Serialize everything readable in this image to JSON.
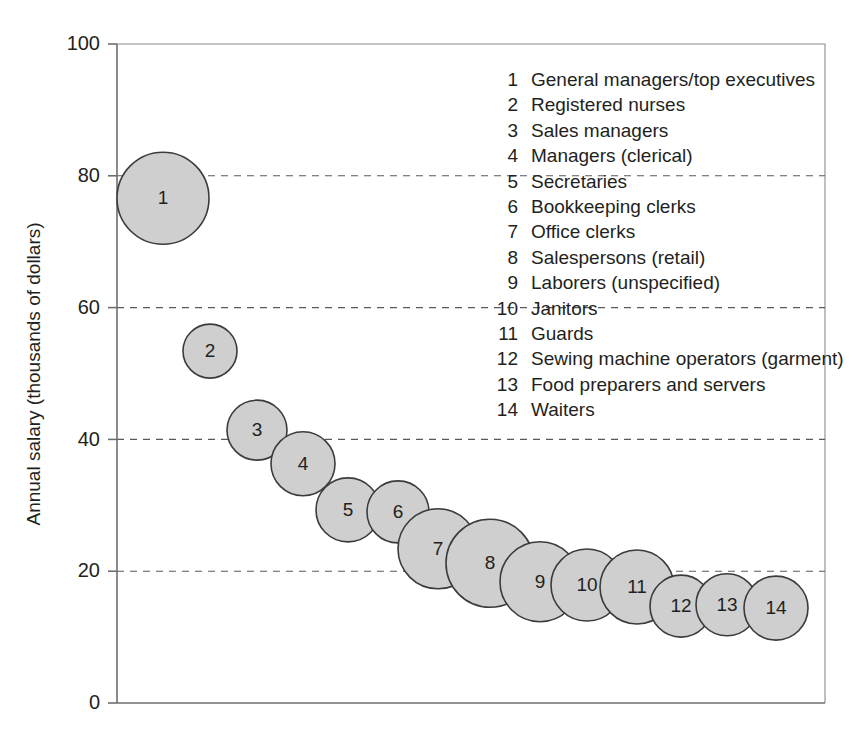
{
  "chart_data": {
    "type": "scatter",
    "title": "",
    "xlabel": "",
    "ylabel": "Annual salary (thousands of dollars)",
    "ylim": [
      0,
      100
    ],
    "yticks": [
      0,
      20,
      40,
      60,
      80,
      100
    ],
    "ytick_labels": [
      "0",
      "20",
      "40",
      "60",
      "80",
      "100"
    ],
    "grid": "horizontal-dashed",
    "legend_position": "inside-top-right",
    "xaxis_ticks": false,
    "note": "Bubble area encodes number of workers in each occupation; bubbles are ordered left to right by decreasing annual salary.",
    "points": [
      {
        "id": 1,
        "label": "1",
        "name": "General managers/top executives",
        "x": 1,
        "y": 76.6,
        "r_px": 46
      },
      {
        "id": 2,
        "label": "2",
        "name": "Registered nurses",
        "x": 2,
        "y": 53.4,
        "r_px": 27
      },
      {
        "id": 3,
        "label": "3",
        "name": "Sales managers",
        "x": 3,
        "y": 41.4,
        "r_px": 30
      },
      {
        "id": 4,
        "label": "4",
        "name": "Managers (clerical)",
        "x": 4,
        "y": 36.3,
        "r_px": 32
      },
      {
        "id": 5,
        "label": "5",
        "name": "Secretaries",
        "x": 5,
        "y": 29.3,
        "r_px": 32
      },
      {
        "id": 6,
        "label": "6",
        "name": "Bookkeeping clerks",
        "x": 6,
        "y": 29.0,
        "r_px": 31
      },
      {
        "id": 7,
        "label": "7",
        "name": "Office clerks",
        "x": 7,
        "y": 23.4,
        "r_px": 40
      },
      {
        "id": 8,
        "label": "8",
        "name": "Salespersons (retail)",
        "x": 8,
        "y": 21.2,
        "r_px": 44
      },
      {
        "id": 9,
        "label": "9",
        "name": "Laborers (unspecified)",
        "x": 9,
        "y": 18.4,
        "r_px": 40
      },
      {
        "id": 10,
        "label": "10",
        "name": "Janitors",
        "x": 10,
        "y": 17.9,
        "r_px": 36
      },
      {
        "id": 11,
        "label": "11",
        "name": "Guards",
        "x": 11,
        "y": 17.6,
        "r_px": 37
      },
      {
        "id": 12,
        "label": "12",
        "name": "Sewing machine operators (garment)",
        "x": 12,
        "y": 14.7,
        "r_px": 31
      },
      {
        "id": 13,
        "label": "13",
        "name": "Food preparers and servers",
        "x": 13,
        "y": 14.9,
        "r_px": 31
      },
      {
        "id": 14,
        "label": "14",
        "name": "Waiters",
        "x": 14,
        "y": 14.4,
        "r_px": 32
      }
    ],
    "colors": {
      "bubble_fill": "#cfcfcf",
      "bubble_stroke": "#3b3b3d",
      "axis": "#6d6e71",
      "gridline": "#58595b",
      "text": "#231f20",
      "background": "#ffffff"
    }
  },
  "legend": {
    "entries": [
      {
        "num": "1",
        "label": "General managers/top executives"
      },
      {
        "num": "2",
        "label": "Registered nurses"
      },
      {
        "num": "3",
        "label": "Sales managers"
      },
      {
        "num": "4",
        "label": "Managers (clerical)"
      },
      {
        "num": "5",
        "label": "Secretaries"
      },
      {
        "num": "6",
        "label": "Bookkeeping clerks"
      },
      {
        "num": "7",
        "label": "Office clerks"
      },
      {
        "num": "8",
        "label": "Salespersons (retail)"
      },
      {
        "num": "9",
        "label": "Laborers (unspecified)"
      },
      {
        "num": "10",
        "label": "Janitors"
      },
      {
        "num": "11",
        "label": "Guards"
      },
      {
        "num": "12",
        "label": "Sewing machine operators (garment)"
      },
      {
        "num": "13",
        "label": "Food preparers and servers"
      },
      {
        "num": "14",
        "label": "Waiters"
      }
    ]
  },
  "axes": {
    "y_title": "Annual salary (thousands of dollars)",
    "y_tick_labels": [
      "100",
      "80",
      "60",
      "40",
      "20",
      "0"
    ]
  }
}
